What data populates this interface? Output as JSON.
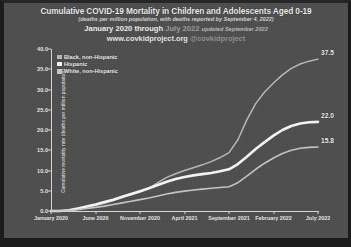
{
  "figure": {
    "background_color": "#4e4e4e",
    "title": "Cumulative COVID-19 Mortality in Children and Adolescents Aged 0-19",
    "subtitle": "(deaths per million population, with deaths reported by September 4, 2022)",
    "range_prefix": "January 2020 through",
    "range_highlight": "July 2022",
    "range_updated": "updated September 2022",
    "url": "www.covkidproject.org",
    "handle": "@covkidproject"
  },
  "chart_data": {
    "type": "line",
    "title": "Cumulative COVID-19 Mortality in Children and Adolescents Aged 0-19",
    "subtitle": "(deaths per million population, with deaths reported by September 4, 2022)",
    "xlabel": "Month of Death",
    "ylabel": "Cumulative mortality rate (deaths per million population)",
    "ylim": [
      0.0,
      40.0
    ],
    "yticks": [
      "0.0",
      "5.0",
      "10.0",
      "15.0",
      "20.0",
      "25.0",
      "30.0",
      "35.0",
      "40.0"
    ],
    "ytick_values": [
      0.0,
      5.0,
      10.0,
      15.0,
      20.0,
      25.0,
      30.0,
      35.0,
      40.0
    ],
    "grid": false,
    "legend_position": "upper-left",
    "xticks": [
      "January 2020",
      "June 2020",
      "November 2020",
      "April 2021",
      "September 2021",
      "February 2022",
      "July 2022"
    ],
    "xtick_months": [
      0,
      5,
      10,
      15,
      20,
      25,
      30
    ],
    "x": [
      0,
      1,
      2,
      3,
      4,
      5,
      6,
      7,
      8,
      9,
      10,
      11,
      12,
      13,
      14,
      15,
      16,
      17,
      18,
      19,
      20,
      21,
      22,
      23,
      24,
      25,
      26,
      27,
      28,
      29,
      30
    ],
    "series": [
      {
        "name": "Black, non-Hispanic",
        "color": "#b9b9b9",
        "end_value": "37.5",
        "values": [
          0.0,
          0.0,
          0.2,
          0.6,
          1.0,
          1.4,
          1.9,
          2.6,
          3.3,
          4.0,
          4.7,
          5.6,
          7.0,
          8.3,
          9.2,
          10.0,
          10.7,
          11.4,
          12.2,
          13.2,
          14.4,
          17.6,
          22.5,
          26.5,
          29.4,
          31.6,
          33.6,
          35.2,
          36.3,
          37.0,
          37.5
        ]
      },
      {
        "name": "Hispanic",
        "color": "#f7f7f7",
        "end_value": "22.0",
        "values": [
          0.0,
          0.0,
          0.2,
          0.6,
          1.1,
          1.6,
          2.2,
          2.8,
          3.5,
          4.2,
          4.9,
          5.6,
          6.4,
          7.2,
          7.9,
          8.4,
          8.8,
          9.1,
          9.4,
          9.8,
          10.3,
          11.6,
          13.4,
          15.3,
          17.0,
          18.6,
          20.0,
          21.0,
          21.6,
          21.9,
          22.0
        ]
      },
      {
        "name": "White, non-Hispanic",
        "color": "#c6c6c6",
        "end_value": "15.8",
        "values": [
          0.0,
          0.0,
          0.1,
          0.3,
          0.6,
          0.9,
          1.2,
          1.6,
          2.0,
          2.4,
          2.8,
          3.2,
          3.7,
          4.2,
          4.6,
          4.9,
          5.2,
          5.4,
          5.6,
          5.8,
          6.0,
          7.0,
          8.6,
          10.3,
          11.8,
          13.1,
          14.2,
          15.0,
          15.5,
          15.7,
          15.8
        ]
      }
    ]
  }
}
